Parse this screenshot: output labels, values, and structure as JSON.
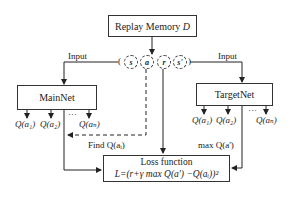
{
  "diagram": {
    "replay_memory": {
      "label": "Replay Memory",
      "symbol": "D"
    },
    "transition": {
      "items": [
        "s",
        "a",
        "r",
        "s'"
      ],
      "open": "(",
      "close": ")"
    },
    "mainnet": {
      "label": "MainNet",
      "input_label": "Input",
      "outputs": [
        "Q(a₁)",
        "Q(a₂)",
        "…",
        "Q(aₙ)"
      ]
    },
    "targetnet": {
      "label": "TargetNet",
      "input_label": "Input",
      "outputs": [
        "Q(a₁)",
        "Q(a₂)",
        "…",
        "Q(aₙ)"
      ],
      "max_label": "max Q(a')"
    },
    "find_label": "Find Q(aᵢ)",
    "loss": {
      "title": "Loss function",
      "formula": "L=(r+γ max Q(a') −Q(aᵢ))²"
    }
  }
}
